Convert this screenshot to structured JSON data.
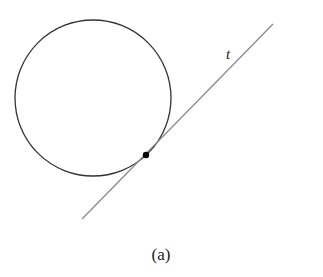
{
  "figure": {
    "caption": "(a)",
    "line_label": "t",
    "circle": {
      "cx": 93,
      "cy": 98,
      "r": 78,
      "stroke": "#333333"
    },
    "tangent_line": {
      "x1": 82,
      "y1": 219,
      "x2": 273,
      "y2": 24,
      "stroke": "#888888"
    },
    "tangent_point": {
      "cx": 146,
      "cy": 155,
      "r": 3.2,
      "fill": "#000000"
    }
  }
}
